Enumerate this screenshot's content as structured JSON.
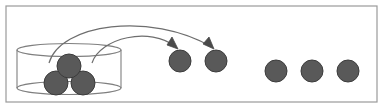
{
  "figure": {
    "title": "Balls being removed from a container and arranged in a row",
    "canvas": {
      "width": 384,
      "height": 109,
      "background": "#ffffff"
    },
    "frame": {
      "label": "outer-border",
      "x": 6,
      "y": 6,
      "width": 371,
      "height": 96,
      "stroke": "#9a9a9a",
      "stroke_width": 1.2,
      "fill": "#ffffff"
    },
    "container": {
      "label": "cylinder",
      "description": "open-top transparent cylinder holding three balls",
      "center_x": 69,
      "top_ellipse_y": 50,
      "bottom_ellipse_y": 88,
      "radius_x": 52,
      "radius_y": 6.5,
      "stroke": "#7f7f7f",
      "stroke_width": 1.1,
      "fill": "none"
    },
    "ball_style": {
      "fill": "#595959",
      "stroke": "#3c3c3c",
      "stroke_width": 1.0,
      "radius": 11
    },
    "balls_in_container": [
      {
        "name": "ball-in-container-top",
        "cx": 69,
        "cy": 66,
        "r": 12
      },
      {
        "name": "ball-in-container-left",
        "cx": 56,
        "cy": 83,
        "r": 12
      },
      {
        "name": "ball-in-container-right",
        "cx": 83,
        "cy": 83,
        "r": 12
      }
    ],
    "balls_placed": [
      {
        "name": "ball-placed-1",
        "cx": 180,
        "cy": 61,
        "r": 11
      },
      {
        "name": "ball-placed-2",
        "cx": 216,
        "cy": 61,
        "r": 11
      }
    ],
    "balls_row": [
      {
        "name": "ball-row-1",
        "cx": 276,
        "cy": 71,
        "r": 11
      },
      {
        "name": "ball-row-2",
        "cx": 312,
        "cy": 71,
        "r": 11
      },
      {
        "name": "ball-row-3",
        "cx": 348,
        "cy": 71,
        "r": 11
      }
    ],
    "arrows": [
      {
        "name": "transfer-arrow-outer",
        "description": "curved arrow from container to second placed ball",
        "path": "M 49,63 C 60,24 150,11 212,47",
        "stroke": "#6e6e6e",
        "stroke_width": 1.2,
        "head": "M 212,48 L 204,42 L 211,39 Z"
      },
      {
        "name": "transfer-arrow-inner",
        "description": "curved arrow from container to first placed ball",
        "path": "M 92,63 C 100,38 150,26 176,47",
        "stroke": "#6e6e6e",
        "stroke_width": 1.2,
        "head": "M 176,48 L 168,43 L 175,39 Z"
      }
    ]
  }
}
